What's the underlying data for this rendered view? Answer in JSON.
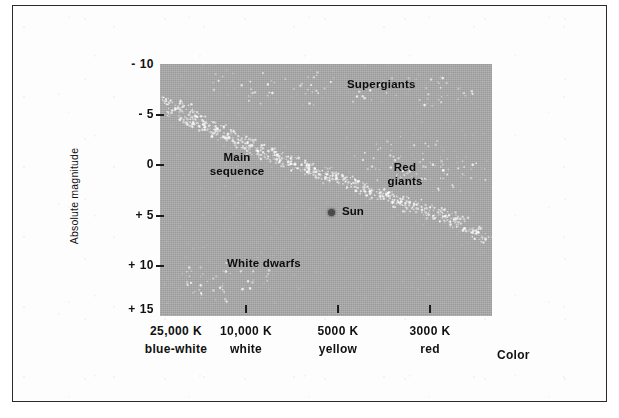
{
  "figure": {
    "background_color": "#ffffff",
    "frame_border_color": "#2a2a2a",
    "plot_fill_color": "#a9a9a9"
  },
  "chart_data": {
    "type": "scatter",
    "title": "",
    "xlabel": "Color",
    "ylabel": "Absolute magnitude",
    "grid": false,
    "legend_position": "none",
    "x_axis": {
      "label": "Color",
      "ticks": [
        {
          "temperature": "25,000 K",
          "color_name": "blue-white"
        },
        {
          "temperature": "10,000 K",
          "color_name": "white"
        },
        {
          "temperature": "5000 K",
          "color_name": "yellow"
        },
        {
          "temperature": "3000 K",
          "color_name": "red"
        }
      ]
    },
    "y_axis": {
      "label": "Absolute magnitude",
      "ticks": [
        "- 10",
        "- 5",
        "0",
        "+ 5",
        "+ 10",
        "+ 15"
      ],
      "range": [
        -10,
        15
      ],
      "inverted": true
    },
    "annotations": [
      {
        "name": "supergiants",
        "text": "Supergiants"
      },
      {
        "name": "main-sequence",
        "line1": "Main",
        "line2": "sequence"
      },
      {
        "name": "red-giants",
        "line1": "Red",
        "line2": "giants"
      },
      {
        "name": "white-dwarfs",
        "text": "White dwarfs"
      },
      {
        "name": "sun",
        "text": "Sun"
      }
    ],
    "series": [
      {
        "name": "Main sequence",
        "description": "Dense diagonal band of stars running from hot, bright upper-left to cool, dim lower-right",
        "points": [
          [
            0.02,
            -6.4
          ],
          [
            0.05,
            -6.0
          ],
          [
            0.04,
            -5.2
          ],
          [
            0.08,
            -5.6
          ],
          [
            0.07,
            -4.6
          ],
          [
            0.1,
            -4.9
          ],
          [
            0.09,
            -4.1
          ],
          [
            0.12,
            -4.4
          ],
          [
            0.13,
            -3.7
          ],
          [
            0.15,
            -3.9
          ],
          [
            0.16,
            -3.2
          ],
          [
            0.18,
            -3.5
          ],
          [
            0.19,
            -2.8
          ],
          [
            0.21,
            -3.0
          ],
          [
            0.22,
            -2.3
          ],
          [
            0.24,
            -2.6
          ],
          [
            0.25,
            -1.9
          ],
          [
            0.27,
            -2.1
          ],
          [
            0.28,
            -1.4
          ],
          [
            0.3,
            -1.7
          ],
          [
            0.31,
            -1.0
          ],
          [
            0.33,
            -1.2
          ],
          [
            0.35,
            -0.6
          ],
          [
            0.36,
            -0.9
          ],
          [
            0.38,
            -0.2
          ],
          [
            0.4,
            -0.5
          ],
          [
            0.41,
            0.2
          ],
          [
            0.43,
            0.0
          ],
          [
            0.45,
            0.6
          ],
          [
            0.46,
            0.3
          ],
          [
            0.48,
            1.0
          ],
          [
            0.5,
            0.7
          ],
          [
            0.51,
            1.4
          ],
          [
            0.53,
            1.1
          ],
          [
            0.55,
            1.8
          ],
          [
            0.57,
            1.5
          ],
          [
            0.58,
            2.2
          ],
          [
            0.6,
            1.9
          ],
          [
            0.62,
            2.6
          ],
          [
            0.63,
            2.3
          ],
          [
            0.65,
            3.0
          ],
          [
            0.67,
            2.7
          ],
          [
            0.68,
            3.4
          ],
          [
            0.7,
            3.1
          ],
          [
            0.72,
            3.8
          ],
          [
            0.74,
            3.5
          ],
          [
            0.75,
            4.2
          ],
          [
            0.77,
            3.9
          ],
          [
            0.79,
            4.6
          ],
          [
            0.81,
            4.3
          ],
          [
            0.82,
            5.0
          ],
          [
            0.84,
            4.7
          ],
          [
            0.86,
            5.4
          ],
          [
            0.88,
            5.1
          ],
          [
            0.89,
            5.8
          ],
          [
            0.91,
            5.5
          ],
          [
            0.93,
            6.2
          ],
          [
            0.95,
            6.6
          ],
          [
            0.96,
            7.0
          ],
          [
            0.98,
            7.4
          ]
        ]
      },
      {
        "name": "Supergiants",
        "description": "Sparse scatter of very luminous stars across the top of the diagram",
        "points": [
          [
            0.18,
            -8.2
          ],
          [
            0.26,
            -7.6
          ],
          [
            0.34,
            -8.5
          ],
          [
            0.42,
            -7.9
          ],
          [
            0.5,
            -8.3
          ],
          [
            0.58,
            -7.4
          ],
          [
            0.66,
            -8.0
          ],
          [
            0.74,
            -7.7
          ],
          [
            0.82,
            -8.4
          ],
          [
            0.9,
            -7.5
          ],
          [
            0.3,
            -6.9
          ],
          [
            0.46,
            -6.7
          ],
          [
            0.62,
            -7.0
          ],
          [
            0.78,
            -6.6
          ],
          [
            0.88,
            -6.9
          ]
        ]
      },
      {
        "name": "Red giants",
        "description": "Loose cloud of cool luminous stars in the upper-right quadrant",
        "points": [
          [
            0.62,
            -1.2
          ],
          [
            0.68,
            -0.6
          ],
          [
            0.72,
            -1.8
          ],
          [
            0.76,
            -0.2
          ],
          [
            0.8,
            -1.4
          ],
          [
            0.84,
            0.4
          ],
          [
            0.7,
            0.8
          ],
          [
            0.78,
            1.2
          ],
          [
            0.86,
            -0.8
          ],
          [
            0.9,
            0.2
          ],
          [
            0.66,
            0.1
          ],
          [
            0.74,
            1.6
          ],
          [
            0.82,
            1.0
          ],
          [
            0.88,
            1.8
          ],
          [
            0.94,
            0.6
          ]
        ]
      },
      {
        "name": "White dwarfs",
        "description": "Faint hot stars scattered in the lower-left region",
        "points": [
          [
            0.1,
            10.8
          ],
          [
            0.16,
            11.6
          ],
          [
            0.22,
            10.2
          ],
          [
            0.12,
            12.4
          ],
          [
            0.26,
            12.0
          ],
          [
            0.18,
            13.0
          ],
          [
            0.3,
            11.0
          ],
          [
            0.08,
            11.4
          ]
        ]
      },
      {
        "name": "Sun",
        "description": "Single marked star on the main sequence",
        "points": [
          [
            0.505,
            4.8
          ]
        ],
        "marker": "filled-circle",
        "label": "Sun"
      }
    ]
  },
  "axes": {
    "y_ticks": [
      {
        "label": "- 10",
        "top": 57
      },
      {
        "label": "- 5",
        "top": 107
      },
      {
        "label": "0",
        "top": 157
      },
      {
        "label": "+ 5",
        "top": 208
      },
      {
        "label": "+ 10",
        "top": 258
      },
      {
        "label": "+ 15",
        "top": 302
      }
    ],
    "y_tick_marks": [
      107,
      157,
      208,
      258
    ],
    "x_ticks": [
      {
        "temperature": "25,000 K",
        "color_name": "blue-white",
        "center": 176,
        "mark": null
      },
      {
        "temperature": "10,000 K",
        "color_name": "white",
        "center": 246,
        "mark": 246
      },
      {
        "temperature": "5000 K",
        "color_name": "yellow",
        "center": 338,
        "mark": 338
      },
      {
        "temperature": "3000 K",
        "color_name": "red",
        "center": 430,
        "mark": 430
      }
    ],
    "x_axis_title": "Color",
    "y_axis_title": "Absolute magnitude"
  },
  "labels": {
    "supergiants": "Supergiants",
    "main_sequence_line1": "Main",
    "main_sequence_line2": "sequence",
    "red_giants_line1": "Red",
    "red_giants_line2": "giants",
    "white_dwarfs": "White dwarfs",
    "sun": "Sun"
  }
}
